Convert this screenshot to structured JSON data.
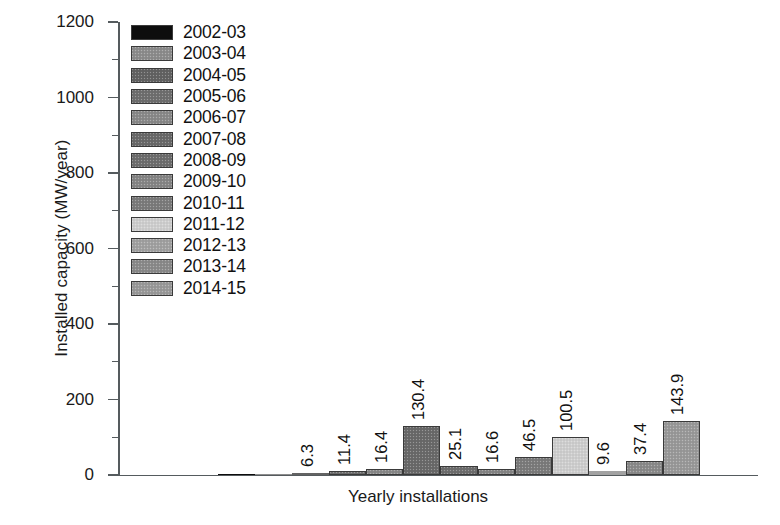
{
  "chart_data": {
    "type": "bar",
    "title": "",
    "xlabel": "Yearly installations",
    "ylabel": "Installed capacity (MW/year)",
    "ylim": [
      0,
      1200
    ],
    "ytick_labels": [
      "1200",
      "1000",
      "800",
      "600",
      "400",
      "200",
      "0"
    ],
    "ytick_values": [
      1200,
      1000,
      800,
      600,
      400,
      200,
      0
    ],
    "ytick_minor_values": [
      1100,
      900,
      700,
      500,
      300,
      100
    ],
    "grid": false,
    "legend_position": "upper-left",
    "categories": [
      "2002-03",
      "2003-04",
      "2004-05",
      "2005-06",
      "2006-07",
      "2007-08",
      "2008-09",
      "2009-10",
      "2010-11",
      "2011-12",
      "2012-13",
      "2013-14",
      "2014-15"
    ],
    "values": [
      0.2,
      0.8,
      6.3,
      11.4,
      16.4,
      130.4,
      25.1,
      16.6,
      46.5,
      100.5,
      9.6,
      37.4,
      143.9
    ],
    "value_labels": [
      "",
      "",
      "6.3",
      "11.4",
      "16.4",
      "130.4",
      "25.1",
      "16.6",
      "46.5",
      "100.5",
      "9.6",
      "37.4",
      "143.9"
    ],
    "bar_colors": [
      "#0d0d0d",
      "#8d8d8d",
      "#636363",
      "#6f6f6f",
      "#8a8a8a",
      "#6a6a6a",
      "#6e6e6e",
      "#868686",
      "#7c7c7c",
      "#cfcfcf",
      "#a2a2a2",
      "#8b8b8b",
      "#9a9a9a"
    ]
  },
  "legend": {
    "items": [
      {
        "label": "2002-03",
        "color": "#0d0d0d"
      },
      {
        "label": "2003-04",
        "color": "#8d8d8d"
      },
      {
        "label": "2004-05",
        "color": "#636363"
      },
      {
        "label": "2005-06",
        "color": "#6f6f6f"
      },
      {
        "label": "2006-07",
        "color": "#8a8a8a"
      },
      {
        "label": "2007-08",
        "color": "#6a6a6a"
      },
      {
        "label": "2008-09",
        "color": "#6e6e6e"
      },
      {
        "label": "2009-10",
        "color": "#868686"
      },
      {
        "label": "2010-11",
        "color": "#7c7c7c"
      },
      {
        "label": "2011-12",
        "color": "#cfcfcf"
      },
      {
        "label": "2012-13",
        "color": "#a2a2a2"
      },
      {
        "label": "2013-14",
        "color": "#8b8b8b"
      },
      {
        "label": "2014-15",
        "color": "#9a9a9a"
      }
    ]
  },
  "axes": {
    "y_title": "Installed capacity (MW/year)",
    "x_title": "Yearly installations"
  }
}
